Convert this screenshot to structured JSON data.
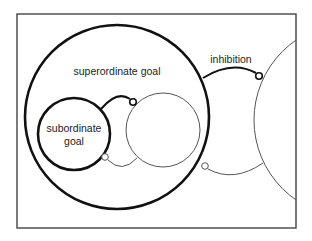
{
  "diagram": {
    "labels": {
      "superordinate": "superordinate goal",
      "subordinate_line1": "subordinate",
      "subordinate_line2": "goal",
      "inhibition": "inhibition"
    },
    "colors": {
      "stroke": "#111111",
      "thin_stroke": "#555555",
      "frame": "#444444",
      "background": "#ffffff"
    },
    "nodes": [
      {
        "id": "superordinate-goal",
        "shape": "circle",
        "weight": "thick"
      },
      {
        "id": "subordinate-goal",
        "shape": "circle",
        "weight": "thick"
      },
      {
        "id": "sibling-goal",
        "shape": "circle",
        "weight": "thin"
      },
      {
        "id": "competing-goal",
        "shape": "circle",
        "weight": "thin",
        "clipped": true
      }
    ],
    "edges": [
      {
        "from": "subordinate-goal",
        "to": "sibling-goal",
        "type": "inhibition",
        "weight": "thick"
      },
      {
        "from": "sibling-goal",
        "to": "subordinate-goal",
        "type": "inhibition",
        "weight": "thin"
      },
      {
        "from": "superordinate-goal",
        "to": "competing-goal",
        "type": "inhibition",
        "weight": "thick",
        "label": "inhibition"
      },
      {
        "from": "competing-goal",
        "to": "superordinate-goal",
        "type": "inhibition",
        "weight": "thin"
      }
    ]
  }
}
